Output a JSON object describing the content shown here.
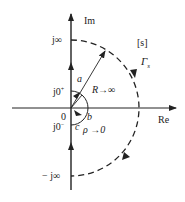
{
  "diagram": {
    "plane_label": "[s]",
    "contour_label": "Γ",
    "contour_subscript": "s",
    "axes": {
      "imag_label": "Im",
      "real_label": "Re"
    },
    "ticks": {
      "top": "j∞",
      "bottom": "− j∞",
      "j0_plus_base": "j0",
      "j0_plus_sup": "+",
      "j0_minus_base": "j0",
      "j0_minus_sup": "−",
      "origin": "0"
    },
    "points": {
      "a": "a",
      "b": "b",
      "c": "c"
    },
    "annotations": {
      "big_radius": "R→∞",
      "small_radius": "ρ →0"
    },
    "colors": {
      "stroke": "#222222",
      "background": "#ffffff"
    }
  }
}
